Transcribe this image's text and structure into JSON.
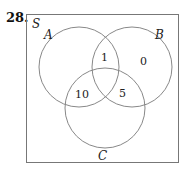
{
  "problem_number": "28.",
  "venn": {
    "universe_label": "S",
    "sets": [
      {
        "label": "A",
        "cx": 79,
        "cy": 67,
        "r": 40
      },
      {
        "label": "B",
        "cx": 132,
        "cy": 67,
        "r": 40
      },
      {
        "label": "C",
        "cx": 105,
        "cy": 108,
        "r": 40
      }
    ],
    "regions": {
      "A_and_B_only": "1",
      "B_only": "0",
      "A_and_C_only": "10",
      "B_and_C_only": "5"
    },
    "colors": {
      "stroke": "#888888",
      "frame": "#777777",
      "text": "#222222"
    }
  }
}
